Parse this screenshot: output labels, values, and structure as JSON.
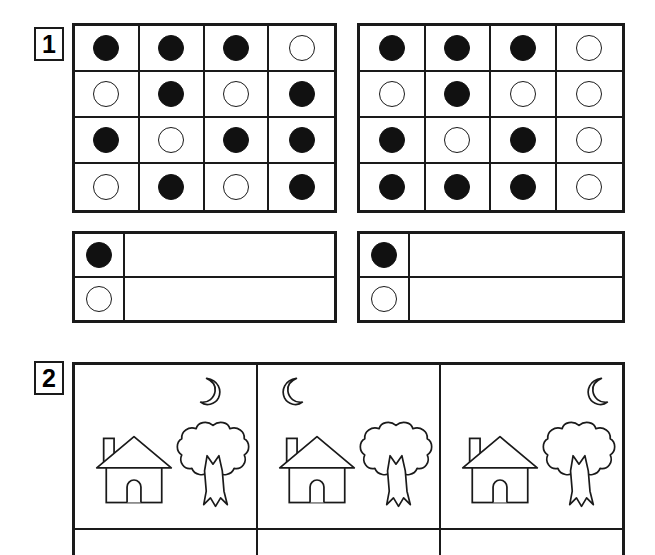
{
  "worksheet": {
    "page_background": "#ffffff",
    "ink_color": "#1a1a1a"
  },
  "exercises": [
    {
      "number": "1",
      "badge_label": "1",
      "type": "dot-grid-count",
      "grids": [
        {
          "name": "left-grid",
          "rows": 4,
          "cols": 4,
          "cells": [
            [
              "filled",
              "filled",
              "filled",
              "empty"
            ],
            [
              "empty",
              "filled",
              "empty",
              "filled"
            ],
            [
              "filled",
              "empty",
              "filled",
              "filled"
            ],
            [
              "empty",
              "filled",
              "empty",
              "filled"
            ]
          ],
          "filled_count": 9,
          "empty_count": 7
        },
        {
          "name": "right-grid",
          "rows": 4,
          "cols": 4,
          "cells": [
            [
              "filled",
              "filled",
              "filled",
              "empty"
            ],
            [
              "empty",
              "filled",
              "empty",
              "empty"
            ],
            [
              "filled",
              "empty",
              "filled",
              "empty"
            ],
            [
              "filled",
              "filled",
              "filled",
              "empty"
            ]
          ],
          "filled_count": 9,
          "empty_count": 7
        }
      ],
      "tally_boxes": [
        {
          "name": "left-tally",
          "rows": [
            {
              "key": "filled",
              "answer": ""
            },
            {
              "key": "empty",
              "answer": ""
            }
          ]
        },
        {
          "name": "right-tally",
          "rows": [
            {
              "key": "filled",
              "answer": ""
            },
            {
              "key": "empty",
              "answer": ""
            }
          ]
        }
      ]
    },
    {
      "number": "2",
      "badge_label": "2",
      "type": "picture-scene-compare",
      "panels": [
        {
          "name": "panel-1",
          "items": [
            "moon-icon",
            "house-icon",
            "tree-icon"
          ],
          "moon_shape": "waxing-crescent-opens-left",
          "moon_position": "right",
          "answer": ""
        },
        {
          "name": "panel-2",
          "items": [
            "moon-icon",
            "house-icon",
            "tree-icon"
          ],
          "moon_shape": "waning-crescent-opens-right",
          "moon_position": "left",
          "answer": ""
        },
        {
          "name": "panel-3",
          "items": [
            "moon-icon",
            "house-icon",
            "tree-icon"
          ],
          "moon_shape": "waning-crescent-opens-right",
          "moon_position": "right",
          "answer": ""
        }
      ],
      "answer_row": [
        {
          "name": "panel-1-answer",
          "value": ""
        },
        {
          "name": "panel-2-answer",
          "value": ""
        },
        {
          "name": "panel-3-answer",
          "value": ""
        }
      ]
    }
  ]
}
